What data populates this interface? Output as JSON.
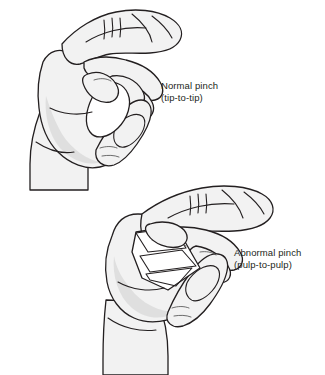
{
  "figure": {
    "background_color": "#ffffff",
    "line_color": "#231f20",
    "skin_fill": "#f2f2f2",
    "shadow_fill": "#d9d9d9",
    "text_color": "#231f20"
  },
  "labels": {
    "normal": {
      "title": "Normal pinch",
      "subtitle": "(tip-to-tip)"
    },
    "abnormal": {
      "title": "Abnormal pinch",
      "subtitle": "(pulp-to-pulp)"
    }
  },
  "illustrations": [
    {
      "name": "upper-hand-normal-pinch",
      "description": "Right hand in profile with thumb and index finger meeting at their tips forming a rounded O-shaped opening; remaining fingers curled behind.",
      "pinch_type": "tip-to-tip"
    },
    {
      "name": "lower-hand-abnormal-pinch",
      "description": "Right hand in profile with thumb and index finger meeting along their pulps, collapsing into a flat angular opening; remaining fingers extended.",
      "pinch_type": "pulp-to-pulp"
    }
  ]
}
